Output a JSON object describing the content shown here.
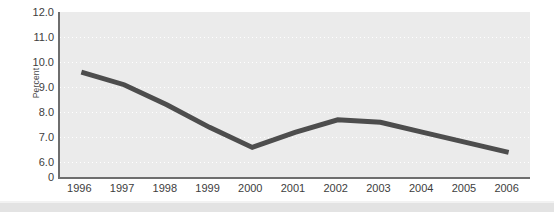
{
  "chart_data": {
    "type": "line",
    "title": "",
    "subtitle": "",
    "xlabel": "",
    "ylabel": "Percent",
    "categories": [
      "1996",
      "1997",
      "1998",
      "1999",
      "2000",
      "2001",
      "2002",
      "2003",
      "2004",
      "2005",
      "2006"
    ],
    "values": [
      9.6,
      9.1,
      8.3,
      7.4,
      6.6,
      7.2,
      7.7,
      7.6,
      7.2,
      6.8,
      6.4
    ],
    "series": [
      {
        "name": "Percent",
        "values": [
          9.6,
          9.1,
          8.3,
          7.4,
          6.6,
          7.2,
          7.7,
          7.6,
          7.2,
          6.8,
          6.4
        ],
        "color": "#4d4d4d"
      }
    ],
    "ylim": [
      6.0,
      12.0
    ],
    "y_axis_broken_at_zero": true,
    "yticks": [
      {
        "label": "12.0",
        "value": 12.0,
        "gridline": false
      },
      {
        "label": "11.0",
        "value": 11.0,
        "gridline": true
      },
      {
        "label": "10.0",
        "value": 10.0,
        "gridline": true
      },
      {
        "label": "9.0",
        "value": 9.0,
        "gridline": true
      },
      {
        "label": "8.0",
        "value": 8.0,
        "gridline": true
      },
      {
        "label": "7.0",
        "value": 7.0,
        "gridline": true
      },
      {
        "label": "6.0",
        "value": 6.0,
        "gridline": true
      },
      {
        "label": "0",
        "value": 5.42,
        "gridline": false
      }
    ],
    "grid": true,
    "grid_style": "dotted-white-horizontal",
    "legend": false,
    "legend_position": "none",
    "annotations": []
  },
  "style": {
    "plot_background": "#ebebeb",
    "page_background": "#ffffff",
    "axis_color": "#6e6e6e",
    "tick_label_color": "#3d3d3d",
    "line_color": "#4d4d4d",
    "line_width": 5,
    "gridline_color": "#ffffff",
    "footer_strip_color": "#e3e3e3"
  }
}
